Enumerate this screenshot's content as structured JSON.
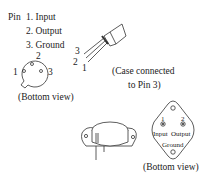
{
  "legend": {
    "prefix": "Pin",
    "items": [
      "1. Input",
      "2. Output",
      "3. Ground"
    ]
  },
  "to92_bottom": {
    "pin_labels": [
      "1",
      "2",
      "3"
    ],
    "caption": "(Bottom view)"
  },
  "to92_side": {
    "pin_labels": [
      "3",
      "2",
      "1"
    ]
  },
  "case_note": {
    "line1": "(Case connected",
    "line2": "to Pin 3)"
  },
  "to3_bottom": {
    "pin1_num": "1",
    "pin2_num": "2",
    "pin1_label": "Input",
    "pin2_label": "Output",
    "case_label": "Ground",
    "caption": "(Bottom view)"
  }
}
